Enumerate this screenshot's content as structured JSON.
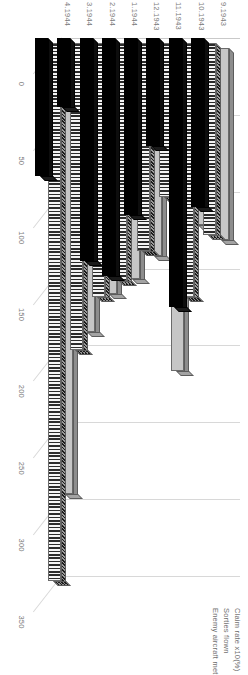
{
  "chart_data": {
    "type": "bar",
    "orientation": "horizontal-3d",
    "title": "",
    "xlabel": "",
    "ylabel": "",
    "categories": [
      "9.1943",
      "10.1943",
      "11.1943",
      "12.1943",
      "1.1944",
      "2.1944",
      "3.1944",
      "4.1944"
    ],
    "ticks": [
      "0",
      "50",
      "100",
      "150",
      "200",
      "250",
      "300",
      "350"
    ],
    "ylim": [
      0,
      350
    ],
    "grid": true,
    "legend_position": "right",
    "series": [
      {
        "name": "Claim rate x10(%)",
        "values": [
          125,
          115,
          210,
          135,
          150,
          160,
          185,
          290
        ]
      },
      {
        "name": "Sorties flown",
        "values": [
          125,
          165,
          100,
          135,
          155,
          165,
          200,
          350
        ]
      },
      {
        "name": "Enemy aircraft met",
        "values": [
          110,
          175,
          70,
          115,
          155,
          145,
          45,
          90
        ]
      }
    ],
    "colors": {
      "claim_rate": "#c6c6c6",
      "sorties_flown": "#2b2b2b",
      "enemy_aircraft_met": "#000000",
      "gridline": "#d8d8d8",
      "tick_label": "#7a7a7a",
      "legend_label": "#6f6f6f"
    }
  }
}
